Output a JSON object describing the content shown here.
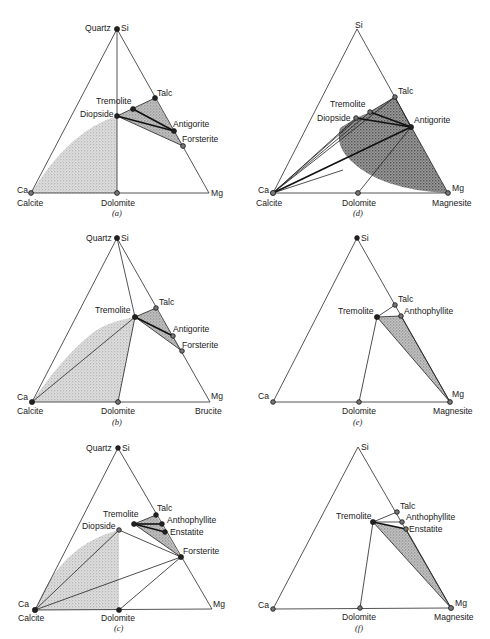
{
  "figure": {
    "shade_color": "#bdbdbd",
    "dark_shade_color": "#6e6e6e",
    "line_color": "#2a2a2a"
  },
  "panels": [
    {
      "id": "a",
      "caption": "(a)",
      "vertices": {
        "top": "Si",
        "top_mineral": "Quartz",
        "left": "Ca",
        "left_mineral": "Calcite",
        "right": "Mg",
        "right_mineral": ""
      },
      "minerals": [
        "Quartz",
        "Calcite",
        "Dolomite",
        "Diopside",
        "Tremolite",
        "Talc",
        "Antigorite",
        "Forsterite"
      ],
      "labels": {
        "quartz": "Quartz",
        "si": "Si",
        "ca": "Ca",
        "calcite": "Calcite",
        "mg": "Mg",
        "dolomite": "Dolomite",
        "tremolite": "Tremolite",
        "diopside": "Diopside",
        "talc": "Talc",
        "antigorite": "Antigorite",
        "forsterite": "Forsterite"
      }
    },
    {
      "id": "d",
      "caption": "(d)",
      "vertices": {
        "top": "Si",
        "left": "Ca",
        "left_mineral": "Calcite",
        "right": "Mg",
        "right_mineral": "Magnesite"
      },
      "minerals": [
        "Calcite",
        "Dolomite",
        "Magnesite",
        "Diopside",
        "Tremolite",
        "Talc",
        "Antigorite"
      ],
      "labels": {
        "si": "Si",
        "ca": "Ca",
        "calcite": "Calcite",
        "mg": "Mg",
        "magnesite": "Magnesite",
        "dolomite": "Dolomite",
        "tremolite": "Tremolite",
        "diopside": "Diopside",
        "talc": "Talc",
        "antigorite": "Antigorite"
      }
    },
    {
      "id": "b",
      "caption": "(b)",
      "vertices": {
        "top": "Si",
        "top_mineral": "Quartz",
        "left": "Ca",
        "left_mineral": "Calcite",
        "right": "Mg",
        "right_mineral": "Brucite"
      },
      "minerals": [
        "Quartz",
        "Calcite",
        "Dolomite",
        "Brucite",
        "Tremolite",
        "Talc",
        "Antigorite",
        "Forsterite"
      ],
      "labels": {
        "quartz": "Quartz",
        "si": "Si",
        "ca": "Ca",
        "calcite": "Calcite",
        "mg": "Mg",
        "brucite": "Brucite",
        "dolomite": "Dolomite",
        "tremolite": "Tremolite",
        "talc": "Talc",
        "antigorite": "Antigorite",
        "forsterite": "Forsterite"
      }
    },
    {
      "id": "e",
      "caption": "(e)",
      "vertices": {
        "top": "Si",
        "left": "Ca",
        "right": "Mg",
        "right_mineral": "Magnesite"
      },
      "minerals": [
        "Dolomite",
        "Magnesite",
        "Tremolite",
        "Talc",
        "Anthophyllite"
      ],
      "labels": {
        "si": "Si",
        "ca": "Ca",
        "mg": "Mg",
        "magnesite": "Magnesite",
        "dolomite": "Dolomite",
        "tremolite": "Tremolite",
        "talc": "Talc",
        "anthophyllite": "Anthophyllite"
      }
    },
    {
      "id": "c",
      "caption": "(c)",
      "vertices": {
        "top": "Si",
        "top_mineral": "Quartz",
        "left": "Ca",
        "left_mineral": "Calcite",
        "right": "Mg"
      },
      "minerals": [
        "Quartz",
        "Calcite",
        "Dolomite",
        "Diopside",
        "Tremolite",
        "Talc",
        "Anthophyllite",
        "Enstatite",
        "Forsterite"
      ],
      "labels": {
        "quartz": "Quartz",
        "si": "Si",
        "ca": "Ca",
        "calcite": "Calcite",
        "mg": "Mg",
        "dolomite": "Dolomite",
        "tremolite": "Tremolite",
        "diopside": "Diopside",
        "talc": "Talc",
        "anthophyllite": "Anthophyllite",
        "enstatite": "Enstatite",
        "forsterite": "Forsterite"
      }
    },
    {
      "id": "f",
      "caption": "(f)",
      "vertices": {
        "top": "Si",
        "left": "Ca",
        "right": "Mg",
        "right_mineral": "Magnesite"
      },
      "minerals": [
        "Dolomite",
        "Magnesite",
        "Tremolite",
        "Talc",
        "Anthophyllite",
        "Enstatite"
      ],
      "labels": {
        "si": "Si",
        "ca": "Ca",
        "mg": "Mg",
        "magnesite": "Magnesite",
        "dolomite": "Dolomite",
        "tremolite": "Tremolite",
        "talc": "Talc",
        "anthophyllite": "Anthophyllite",
        "enstatite": "Enstatite"
      }
    }
  ]
}
